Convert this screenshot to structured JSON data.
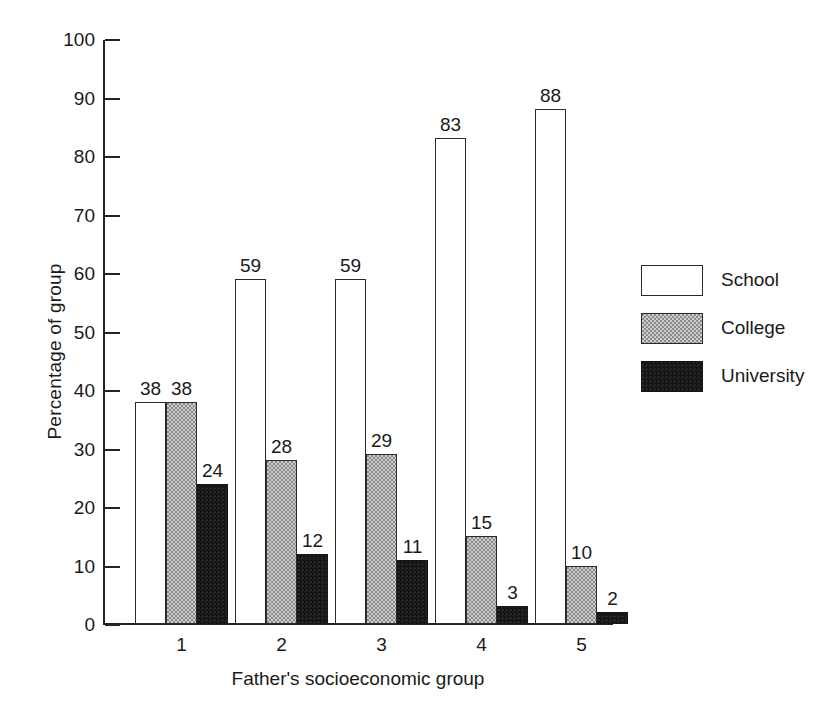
{
  "chart_data": {
    "type": "bar",
    "title": "",
    "xlabel": "Father's socioeconomic group",
    "ylabel": "Percentage of group",
    "categories": [
      "1",
      "2",
      "3",
      "4",
      "5"
    ],
    "series": [
      {
        "name": "School",
        "values": [
          38,
          59,
          59,
          83,
          88
        ],
        "color": "#ffffff",
        "fill": "white"
      },
      {
        "name": "College",
        "values": [
          38,
          28,
          29,
          15,
          10
        ],
        "color": "#8c8c8c",
        "fill": "gray-stipple"
      },
      {
        "name": "University",
        "values": [
          24,
          12,
          11,
          3,
          2
        ],
        "color": "#151515",
        "fill": "black"
      }
    ],
    "ylim": [
      0,
      100
    ],
    "yticks": [
      "0",
      "10",
      "20",
      "30",
      "40",
      "50",
      "60",
      "70",
      "80",
      "90",
      "100"
    ],
    "ytick_values": [
      0,
      10,
      20,
      30,
      40,
      50,
      60,
      70,
      80,
      90,
      100
    ],
    "grid": false,
    "legend_position": "right",
    "data_labels": true,
    "bar_gap_within_group": 0
  },
  "legend": {
    "items": [
      {
        "label": "School"
      },
      {
        "label": "College"
      },
      {
        "label": "University"
      }
    ]
  },
  "axes": {
    "y_title": "Percentage of group",
    "x_title": "Father's socioeconomic group"
  }
}
